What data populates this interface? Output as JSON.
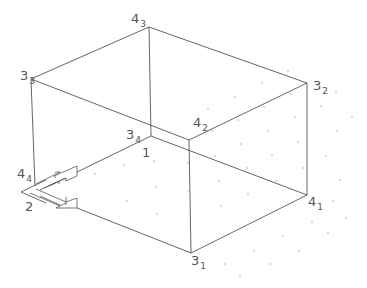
{
  "diagram": {
    "type": "isometric-box-wireframe",
    "colors": {
      "line": "#555555",
      "text": "#555555",
      "dots": "#9a9a9a",
      "background": "#ffffff"
    },
    "vertices": [
      {
        "id": "4_3",
        "main": "4",
        "sub": "3",
        "x": 149,
        "y": 27
      },
      {
        "id": "3_3",
        "main": "3",
        "sub": "3",
        "x": 31,
        "y": 79
      },
      {
        "id": "3_2",
        "main": "3",
        "sub": "2",
        "x": 307,
        "y": 83
      },
      {
        "id": "4_2",
        "main": "4",
        "sub": "2",
        "x": 189,
        "y": 140
      },
      {
        "id": "3_4",
        "main": "3",
        "sub": "4",
        "x": 151,
        "y": 136
      },
      {
        "id": "4_4",
        "main": "4",
        "sub": "4",
        "x": 35,
        "y": 186
      },
      {
        "id": "4_1",
        "main": "4",
        "sub": "1",
        "x": 307,
        "y": 195
      },
      {
        "id": "3_1",
        "main": "3",
        "sub": "1",
        "x": 191,
        "y": 253
      }
    ],
    "labels": [
      {
        "id": "lbl-4_3",
        "main": "4",
        "sub": "3",
        "x": 131,
        "y": 23
      },
      {
        "id": "lbl-3_3",
        "main": "3",
        "sub": "3",
        "x": 20,
        "y": 80
      },
      {
        "id": "lbl-3_2",
        "main": "3",
        "sub": "2",
        "x": 313,
        "y": 90
      },
      {
        "id": "lbl-4_2",
        "main": "4",
        "sub": "2",
        "x": 193,
        "y": 127
      },
      {
        "id": "lbl-3_4",
        "main": "3",
        "sub": "4",
        "x": 126,
        "y": 139
      },
      {
        "id": "lbl-4_4",
        "main": "4",
        "sub": "4",
        "x": 17,
        "y": 178
      },
      {
        "id": "lbl-4_1",
        "main": "4",
        "sub": "1",
        "x": 308,
        "y": 206
      },
      {
        "id": "lbl-3_1",
        "main": "3",
        "sub": "1",
        "x": 191,
        "y": 265
      }
    ],
    "plain_labels": [
      {
        "id": "face-1",
        "text": "1",
        "x": 142,
        "y": 157
      },
      {
        "id": "face-2",
        "text": "2",
        "x": 25,
        "y": 211
      }
    ]
  }
}
